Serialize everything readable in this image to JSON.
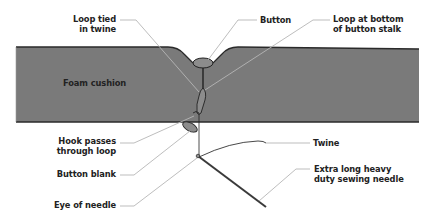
{
  "diagram": {
    "type": "cross-section illustration",
    "colors": {
      "foam": "#7a7a7a",
      "foam_outline": "#2a2a2a",
      "leader_line": "#b5b5b5",
      "label_text": "#222222",
      "needle": "#3a3a3a",
      "button_fill": "#8c8c8c"
    },
    "labels": {
      "loop_tied_line1": "Loop tied",
      "loop_tied_line2": "in twine",
      "button": "Button",
      "loop_bottom_line1": "Loop at bottom",
      "loop_bottom_line2": "of button stalk",
      "foam_cushion": "Foam cushion",
      "hook_line1": "Hook passes",
      "hook_line2": "through loop",
      "button_blank": "Button blank",
      "eye_of_needle": "Eye of needle",
      "twine": "Twine",
      "needle_line1": "Extra long heavy",
      "needle_line2": "duty sewing needle"
    }
  }
}
